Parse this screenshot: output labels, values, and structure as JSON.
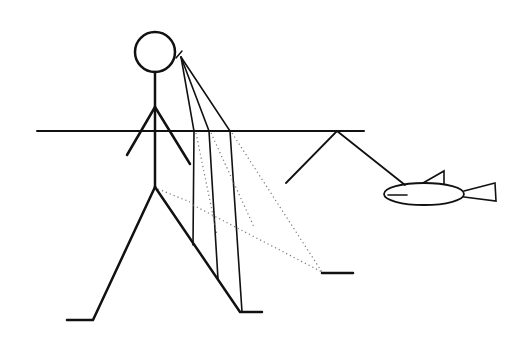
{
  "diagram": {
    "title": "",
    "colors": {
      "ink": "#111111",
      "dotted": "#777777",
      "background": "#ffffff"
    },
    "elements": [
      "person",
      "water-surface",
      "refracted-sight-lines",
      "apparent-sight-lines",
      "apparent-foot-mark",
      "angled-line",
      "fish"
    ]
  }
}
